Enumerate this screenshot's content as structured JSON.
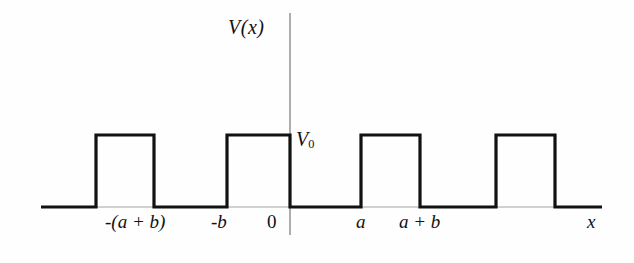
{
  "figure": {
    "background_color": "#fefefe",
    "line_color": "#111111",
    "axis_color": "#555555"
  },
  "labels": {
    "y_axis": "V(x)",
    "x_axis": "x",
    "barrier_height": "V",
    "barrier_height_sub": "0",
    "origin": "0"
  },
  "ticks": [
    {
      "label": "-(a + b)",
      "x": 96
    },
    {
      "label": "-b",
      "x": 226
    },
    {
      "label": "0",
      "x": 290
    },
    {
      "label": "a",
      "x": 361
    },
    {
      "label": "a + b",
      "x": 420
    }
  ],
  "chart_data": {
    "type": "line",
    "xlabel": "x",
    "ylabel": "V(x)",
    "grid": false,
    "legend": null,
    "baseline_value": 0,
    "barrier_value": "V0",
    "period": "a + b",
    "barrier_width": "b",
    "well_width": "a",
    "xlim_px": [
      41,
      602
    ],
    "ylim_px": [
      207,
      135
    ],
    "tick_labels": [
      "-(a + b)",
      "-b",
      "0",
      "a",
      "a + b"
    ],
    "tick_positions_px": [
      96,
      226,
      290,
      361,
      420
    ],
    "barriers_px": [
      {
        "x_start": 96,
        "x_end": 154
      },
      {
        "x_start": 227,
        "x_end": 290
      },
      {
        "x_start": 361,
        "x_end": 420
      },
      {
        "x_start": 496,
        "x_end": 555
      }
    ],
    "baseline_y_px": 207,
    "barrier_top_y_px": 135,
    "y_axis_x_px": 290,
    "y_axis_top_px": 13,
    "y_axis_bottom_px": 235,
    "polyline_points": "41,207 96,207 96,135 154,135 154,207 227,207 227,135 290,135 290,207 361,207 361,135 420,135 420,207 496,207 496,135 555,135 555,207 602,207"
  }
}
